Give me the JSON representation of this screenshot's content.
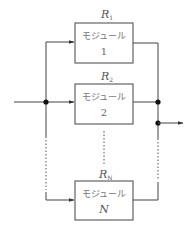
{
  "diagram": {
    "type": "parallel-redundancy-block-diagram",
    "colors": {
      "line": "#555555",
      "junction": "#111111",
      "text": "#777777"
    },
    "modules": [
      {
        "reliability_label": "R",
        "reliability_sub": "1",
        "name": "モジュール",
        "index": "1"
      },
      {
        "reliability_label": "R",
        "reliability_sub": "2",
        "name": "モジュール",
        "index": "2"
      },
      {
        "reliability_label": "R",
        "reliability_sub": "N",
        "name": "モジュール",
        "index": "N"
      }
    ],
    "input": "input-arrow",
    "output": "output-arrow",
    "ellipsis": "dotted-continuation"
  }
}
